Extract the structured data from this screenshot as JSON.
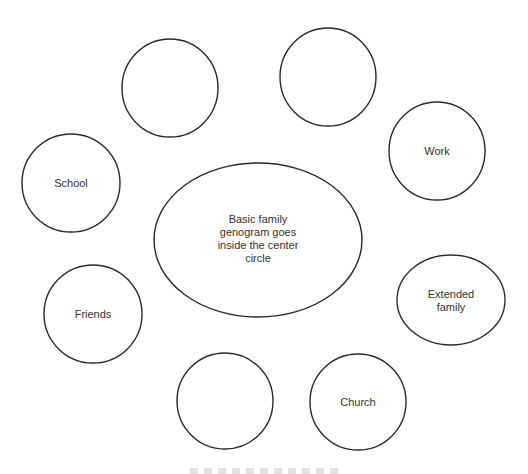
{
  "diagram": {
    "center": {
      "shape": "ellipse",
      "cx": 258,
      "cy": 240,
      "rx": 104,
      "ry": 77,
      "lines": [
        "Basic family",
        "genogram goes",
        "inside the center",
        "circle"
      ]
    },
    "nodes": [
      {
        "id": "blank-top-left",
        "label": "",
        "cx": 170,
        "cy": 88,
        "rx": 48,
        "ry": 49
      },
      {
        "id": "blank-top-right",
        "label": "",
        "cx": 328,
        "cy": 77,
        "rx": 48,
        "ry": 49
      },
      {
        "id": "work",
        "label": "Work",
        "cx": 437,
        "cy": 151,
        "rx": 48,
        "ry": 49
      },
      {
        "id": "school",
        "label": "School",
        "cx": 71,
        "cy": 183,
        "rx": 49,
        "ry": 49
      },
      {
        "id": "extended-family",
        "label": "Extended family",
        "lines": [
          "Extended",
          "family"
        ],
        "cx": 451,
        "cy": 300,
        "rx": 54,
        "ry": 45
      },
      {
        "id": "friends",
        "label": "Friends",
        "cx": 93,
        "cy": 314,
        "rx": 49,
        "ry": 49
      },
      {
        "id": "blank-bottom",
        "label": "",
        "cx": 225,
        "cy": 401,
        "rx": 48,
        "ry": 48
      },
      {
        "id": "church",
        "label": "Church",
        "cx": 358,
        "cy": 402,
        "rx": 48,
        "ry": 48
      }
    ],
    "colors": {
      "stroke": "#2a2a2a",
      "text": "#333333",
      "background": "#ffffff"
    }
  }
}
